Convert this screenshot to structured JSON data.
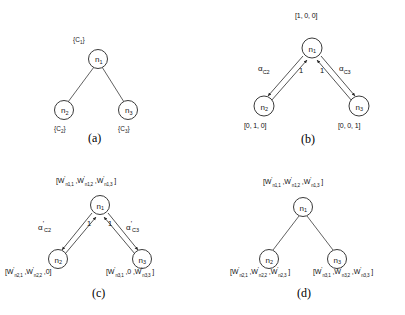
{
  "figure": {
    "background": "#ffffff",
    "stroke_color": "#3a3a3a",
    "panels": [
      {
        "id": "a",
        "caption": "(a)",
        "edge_style": "plain-line",
        "nodes": [
          {
            "id": "n1",
            "label": "n",
            "sub": "1",
            "annotation": "{C",
            "annotation_sub": "1",
            "annotation_end": "}",
            "annotation_pos": "above"
          },
          {
            "id": "n2",
            "label": "n",
            "sub": "2",
            "annotation": "{C",
            "annotation_sub": "2",
            "annotation_end": "}",
            "annotation_pos": "below"
          },
          {
            "id": "n3",
            "label": "n",
            "sub": "3",
            "annotation": "{C",
            "annotation_sub": "3",
            "annotation_end": "}",
            "annotation_pos": "below"
          }
        ]
      },
      {
        "id": "b",
        "caption": "(b)",
        "edge_style": "bidirectional-arrows",
        "nodes": [
          {
            "id": "n1",
            "label": "n",
            "sub": "1",
            "vector": "[1, 0, 0]",
            "vector_pos": "above"
          },
          {
            "id": "n2",
            "label": "n",
            "sub": "2",
            "vector": "[0, 1, 0]",
            "vector_pos": "below"
          },
          {
            "id": "n3",
            "label": "n",
            "sub": "3",
            "vector": "[0, 0, 1]",
            "vector_pos": "below"
          }
        ],
        "edge_labels": [
          {
            "text": "α",
            "sub": "C2",
            "prime": "",
            "side": "left"
          },
          {
            "text": "α",
            "sub": "C3",
            "prime": "",
            "side": "right"
          }
        ],
        "weights": [
          "1",
          "1"
        ]
      },
      {
        "id": "c",
        "caption": "(c)",
        "edge_style": "bidirectional-arrows",
        "nodes": [
          {
            "id": "n1",
            "label": "n",
            "sub": "1",
            "vector_parts": [
              "W|'|n1,1",
              "W|'|n1,2",
              "W|'|n1,3"
            ],
            "vector_pos": "above"
          },
          {
            "id": "n2",
            "label": "n",
            "sub": "2",
            "vector_parts": [
              "W|'|n2,1",
              "W|'|n2,2",
              "0"
            ],
            "vector_pos": "below"
          },
          {
            "id": "n3",
            "label": "n",
            "sub": "3",
            "vector_parts": [
              "W|'|n3,1",
              "0",
              "W|'|n3,3"
            ],
            "vector_pos": "below"
          }
        ],
        "edge_labels": [
          {
            "text": "α",
            "sub": "C2",
            "prime": "'",
            "side": "left"
          },
          {
            "text": "α",
            "sub": "C3",
            "prime": "'",
            "side": "right"
          }
        ],
        "weights": [
          "1",
          "1"
        ]
      },
      {
        "id": "d",
        "caption": "(d)",
        "edge_style": "plain-line",
        "nodes": [
          {
            "id": "n1",
            "label": "n",
            "sub": "1",
            "vector_parts": [
              "W|'|n1,1",
              "W|'|n1,2",
              "W|'|n1,3"
            ],
            "vector_pos": "above"
          },
          {
            "id": "n2",
            "label": "n",
            "sub": "2",
            "vector_parts": [
              "W|'|n2,1",
              "W|'|n2,2",
              "W|'|n2,3"
            ],
            "vector_pos": "below"
          },
          {
            "id": "n3",
            "label": "n",
            "sub": "3",
            "vector_parts": [
              "W|'|n3,1",
              "W|'|n3,2",
              "W|'|n3,3"
            ],
            "vector_pos": "below"
          }
        ]
      }
    ]
  }
}
